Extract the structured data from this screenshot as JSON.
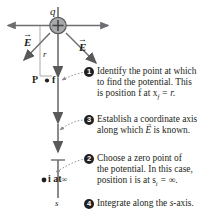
{
  "figure": {
    "charge_label": "q",
    "distance_label": "r",
    "axis_label": "s",
    "field_label_left": "E",
    "field_label_right": "E",
    "point_p_label": "P",
    "point_f_label": "f",
    "point_i_label": "i at",
    "infinity_symbol": "∞",
    "charge_sign": "+",
    "colors": {
      "text": "#231f20",
      "axis": "#6d6e71",
      "charge_fill": "#a7a9ac",
      "badge": "#231f20",
      "badge_text": "#ffffff",
      "leader": "#8c8c8c"
    }
  },
  "steps": [
    {
      "number": "❶",
      "numeral": "1",
      "lines": [
        "Identify the point at which",
        "to find the potential. This",
        "is position f at x"
      ],
      "line3_sub": "f",
      "line3_tail": " = r."
    },
    {
      "number": "❸",
      "numeral": "3",
      "lines": [
        "Establish a coordinate axis",
        "along which E is known."
      ]
    },
    {
      "number": "❷",
      "numeral": "2",
      "lines": [
        "Choose a zero point of",
        "the potential. In this case,",
        "position i is at s"
      ],
      "line3_sub": "i",
      "line3_tail": " = ∞."
    },
    {
      "number": "❹",
      "numeral": "4",
      "lines": [
        "Integrate along the s-axis."
      ]
    }
  ]
}
